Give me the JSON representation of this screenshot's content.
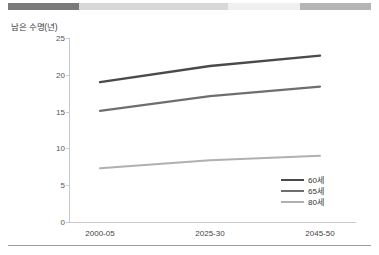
{
  "top_bar": {
    "name": "decorative-segment-bar",
    "segments": [
      {
        "label": "segment-dark",
        "color": "#7a7a7a",
        "width_pct": 19.6
      },
      {
        "label": "segment-light-1",
        "color": "#d8d8d8",
        "width_pct": 41.0
      },
      {
        "label": "segment-lightest",
        "color": "#f0f0f0",
        "width_pct": 19.8
      },
      {
        "label": "segment-medium",
        "color": "#b5b5b5",
        "width_pct": 19.6
      }
    ]
  },
  "chart_data": {
    "type": "line",
    "title": "",
    "subtitle": "",
    "xlabel": "",
    "ylabel": "남은 수명(년)",
    "categories": [
      "2000-05",
      "2025-30",
      "2045-50"
    ],
    "ylim": [
      0,
      25
    ],
    "yticks": [
      0,
      5,
      10,
      15,
      20,
      25
    ],
    "ytick_labels": [
      "0",
      "5",
      "10",
      "15",
      "20",
      "25"
    ],
    "grid": false,
    "legend_position": "inside-bottom-right",
    "series": [
      {
        "name": "60세",
        "color": "#4a4a4a",
        "width": 2.4,
        "values": [
          19.0,
          21.2,
          22.6
        ]
      },
      {
        "name": "65세",
        "color": "#6e6e6e",
        "width": 2.1,
        "values": [
          15.1,
          17.1,
          18.4
        ]
      },
      {
        "name": "80세",
        "color": "#b0b0b0",
        "width": 2.0,
        "values": [
          7.3,
          8.4,
          9.0
        ]
      }
    ]
  },
  "axes": {
    "axis_color": "#c9c9c9"
  }
}
